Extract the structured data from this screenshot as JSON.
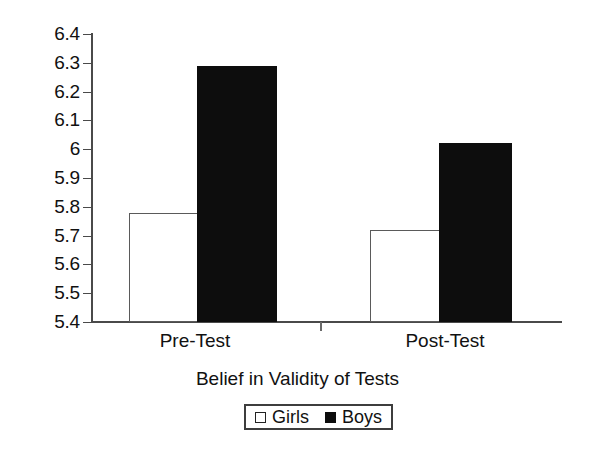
{
  "chart_data": {
    "type": "bar",
    "title": "",
    "subtitle": "",
    "xlabel": "Belief in Validity of Tests",
    "ylabel": "",
    "categories": [
      "Pre-Test",
      "Post-Test"
    ],
    "series": [
      {
        "name": "Girls",
        "values": [
          5.78,
          5.72
        ],
        "color": "#ffffff",
        "edge_color": "#5a5a5a",
        "swatch": "open"
      },
      {
        "name": "Boys",
        "values": [
          6.29,
          6.02
        ],
        "color": "#0d0d0d",
        "edge_color": "#0d0d0d",
        "swatch": "filled"
      }
    ],
    "ylim": [
      5.4,
      6.4
    ],
    "ytick_step": 0.1,
    "ytick_labels": [
      "6.4",
      "6.3",
      "6.2",
      "6.1",
      "6",
      "5.9",
      "5.8",
      "5.7",
      "5.6",
      "5.5",
      "5.4"
    ],
    "ytick_values": [
      6.4,
      6.3,
      6.2,
      6.1,
      6.0,
      5.9,
      5.8,
      5.7,
      5.6,
      5.5,
      5.4
    ],
    "grid": false,
    "legend_position": "bottom-center",
    "legend_entries": [
      "Girls",
      "Boys"
    ],
    "background_color": "#ffffff",
    "axis_color": "#4a4a4a"
  },
  "axis": {
    "x_title": "Belief in Validity of Tests",
    "category_labels": [
      "Pre-Test",
      "Post-Test"
    ],
    "y_tick_labels": [
      "6.4",
      "6.3",
      "6.2",
      "6.1",
      "6",
      "5.9",
      "5.8",
      "5.7",
      "5.6",
      "5.5",
      "5.4"
    ]
  },
  "legend": {
    "items": [
      {
        "label": "Girls",
        "style": "open"
      },
      {
        "label": "Boys",
        "style": "filled"
      }
    ]
  }
}
